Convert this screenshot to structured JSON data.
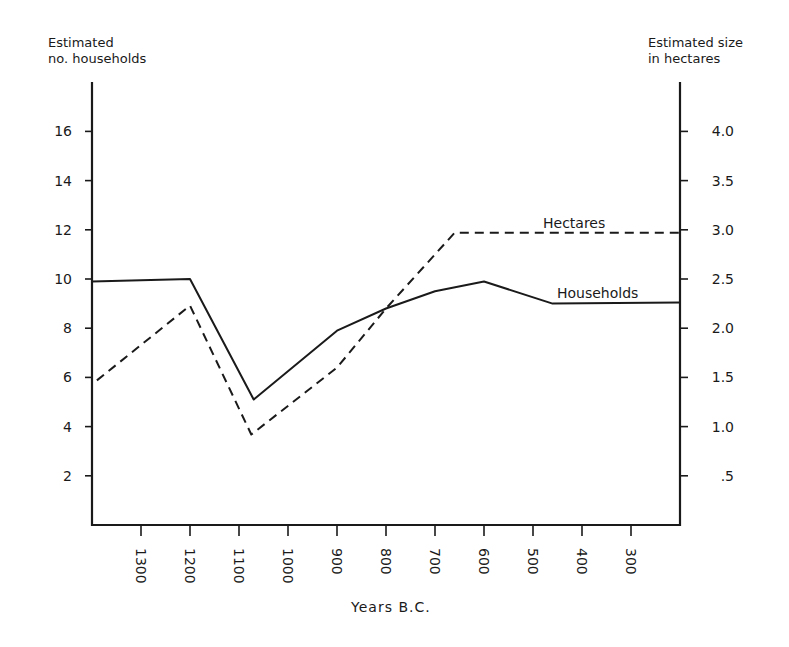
{
  "chart_data": {
    "type": "line",
    "title": "",
    "xlabel": "Years B.C.",
    "ylabel": "Estimated no. households",
    "ylabel_lines": [
      "Estimated",
      "no. households"
    ],
    "y2label": "Estimated size in hectares",
    "y2label_lines": [
      "Estimated size",
      "in hectares"
    ],
    "x_ticks": [
      1300,
      1200,
      1100,
      1000,
      900,
      800,
      700,
      600,
      500,
      400,
      300
    ],
    "x_tick_labels": [
      "1300",
      "1200",
      "1100",
      "1000",
      "900",
      "800",
      "700",
      "600",
      "500",
      "400",
      "300"
    ],
    "xlim": [
      1400,
      200
    ],
    "y_ticks": [
      2,
      4,
      6,
      8,
      10,
      12,
      14,
      16
    ],
    "y_tick_labels": [
      "2",
      "4",
      "6",
      "8",
      "10",
      "12",
      "14",
      "16"
    ],
    "ylim": [
      0,
      18
    ],
    "y2_ticks": [
      0.5,
      1.0,
      1.5,
      2.0,
      2.5,
      3.0,
      3.5,
      4.0
    ],
    "y2_tick_labels": [
      ".5",
      "1.0",
      "1.5",
      "2.0",
      "2.5",
      "3.0",
      "3.5",
      "4.0"
    ],
    "y2lim": [
      0,
      4.5
    ],
    "grid": false,
    "legend": "inline labels",
    "series": [
      {
        "name": "Households",
        "axis": "left",
        "style": "solid",
        "x": [
          1400,
          1200,
          1070,
          900,
          800,
          700,
          600,
          460,
          200
        ],
        "values": [
          9.9,
          10.0,
          5.1,
          7.9,
          8.8,
          9.5,
          9.9,
          9.0,
          9.05
        ]
      },
      {
        "name": "Hectares",
        "axis": "right",
        "style": "dashed",
        "x": [
          1390,
          1200,
          1075,
          900,
          800,
          660,
          200
        ],
        "values": [
          1.47,
          2.23,
          0.92,
          1.6,
          2.2,
          2.97,
          2.97
        ]
      }
    ],
    "annotations": [
      {
        "text": "Hectares",
        "near_series": "Hectares"
      },
      {
        "text": "Households",
        "near_series": "Households"
      }
    ]
  },
  "labels": {
    "left_axis_title": [
      "Estimated",
      "no. households"
    ],
    "right_axis_title": [
      "Estimated size",
      "in hectares"
    ],
    "x_axis_title": "Years B.C.",
    "series_hectares": "Hectares",
    "series_households": "Households"
  },
  "colors": {
    "ink": "#1a1a1a",
    "background": "#ffffff"
  }
}
